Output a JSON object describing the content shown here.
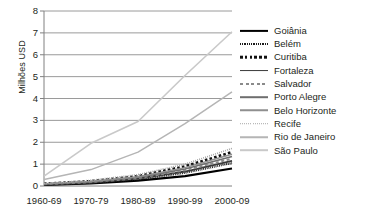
{
  "chart_data": {
    "type": "line",
    "title": "",
    "xlabel": "",
    "ylabel": "Milhões USD",
    "categories": [
      "1960-69",
      "1970-79",
      "1980-89",
      "1990-99",
      "2000-09"
    ],
    "x": [
      0,
      1,
      2,
      3,
      4
    ],
    "ylim": [
      0,
      8
    ],
    "yticks": [
      0,
      1,
      2,
      3,
      4,
      5,
      6,
      7,
      8
    ],
    "grid": true,
    "legend_position": "right",
    "series": [
      {
        "name": "Goiânia",
        "values": [
          0.05,
          0.12,
          0.25,
          0.45,
          0.8
        ],
        "style": "solid-thick",
        "color": "#000000"
      },
      {
        "name": "Belém",
        "values": [
          0.06,
          0.14,
          0.3,
          0.6,
          1.05
        ],
        "style": "dotted-fine",
        "color": "#1a1a1a"
      },
      {
        "name": "Curitiba",
        "values": [
          0.1,
          0.22,
          0.45,
          0.9,
          1.55
        ],
        "style": "dashed-square",
        "color": "#111111"
      },
      {
        "name": "Fortaleza",
        "values": [
          0.07,
          0.16,
          0.34,
          0.66,
          1.15
        ],
        "style": "solid-medium",
        "color": "#3a3a3a"
      },
      {
        "name": "Salvador",
        "values": [
          0.08,
          0.18,
          0.36,
          0.72,
          1.25
        ],
        "style": "dashed-light",
        "color": "#8a8a8a"
      },
      {
        "name": "Porto Alegre",
        "values": [
          0.09,
          0.2,
          0.4,
          0.78,
          1.35
        ],
        "style": "solid-gray",
        "color": "#6e6e6e"
      },
      {
        "name": "Belo Horizonte",
        "values": [
          0.1,
          0.21,
          0.42,
          0.84,
          1.45
        ],
        "style": "solid-gray-light",
        "color": "#8f8f8f"
      },
      {
        "name": "Recife",
        "values": [
          0.12,
          0.26,
          0.52,
          1.0,
          1.72
        ],
        "style": "dotted-gray",
        "color": "#a8a8a8"
      },
      {
        "name": "Rio de Janeiro",
        "values": [
          0.3,
          0.75,
          1.55,
          2.85,
          4.3
        ],
        "style": "solid-light",
        "color": "#b5b5b5"
      },
      {
        "name": "São Paulo",
        "values": [
          0.45,
          1.95,
          2.95,
          5.05,
          7.05
        ],
        "style": "solid-lightest",
        "color": "#c9c9c9"
      }
    ]
  },
  "axes": {
    "ytick_labels": [
      "8",
      "7",
      "6",
      "5",
      "4",
      "3",
      "2",
      "1",
      "0"
    ],
    "xtick_labels": [
      "1960-69",
      "1970-79",
      "1980-89",
      "1990-99",
      "2000-09"
    ],
    "ylabel": "Milhões USD"
  },
  "legend": {
    "items": [
      {
        "label": "Goiânia"
      },
      {
        "label": "Belém"
      },
      {
        "label": "Curitiba"
      },
      {
        "label": "Fortaleza"
      },
      {
        "label": "Salvador"
      },
      {
        "label": "Porto Alegre"
      },
      {
        "label": "Belo Horizonte"
      },
      {
        "label": "Recife"
      },
      {
        "label": "Rio de Janeiro"
      },
      {
        "label": "São Paulo"
      }
    ]
  }
}
